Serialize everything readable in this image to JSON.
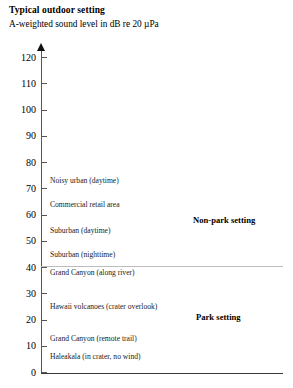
{
  "header": {
    "title": "Typical outdoor setting",
    "subtitle": "A-weighted sound level in dB re 20 µPa"
  },
  "chart_data": {
    "type": "scatter",
    "title": "Typical outdoor setting",
    "subtitle": "A-weighted sound level in dB re 20 µPa",
    "xlabel": "",
    "ylabel": "A-weighted sound level in dB re 20 µPa",
    "ylim": [
      0,
      120
    ],
    "ytick_labels": [
      "120",
      "110",
      "100",
      "90",
      "80",
      "70",
      "60",
      "50",
      "40",
      "30",
      "20",
      "10",
      "0"
    ],
    "ytick_values": [
      120,
      110,
      100,
      90,
      80,
      70,
      60,
      50,
      40,
      30,
      20,
      10,
      0
    ],
    "grid": false,
    "legend": "none",
    "categories": [
      "Noisy urban (daytime)",
      "Commercial retail area",
      "Suburban (daytime)",
      "Suburban (nighttime)",
      "Grand Canyon (along river)",
      "Hawaii volcanoes (crater overlook)",
      "Grand Canyon (remote trail)",
      "Haleakala (in crater, no wind)"
    ],
    "values": [
      73,
      64,
      54,
      45,
      38,
      25,
      13,
      6
    ],
    "annotations": [
      {
        "text": "Non-park setting",
        "value": 58
      },
      {
        "text": "Park setting",
        "value": 21
      }
    ],
    "reference_lines": [
      {
        "value": 40,
        "color": "#bdbdbd"
      },
      {
        "value": 0,
        "color": "#3a3a3a"
      }
    ]
  },
  "axis": {
    "ticks": [
      {
        "label": "120",
        "value": 120
      },
      {
        "label": "110",
        "value": 110
      },
      {
        "label": "100",
        "value": 100
      },
      {
        "label": "90",
        "value": 90
      },
      {
        "label": "80",
        "value": 80
      },
      {
        "label": "70",
        "value": 70
      },
      {
        "label": "60",
        "value": 60
      },
      {
        "label": "50",
        "value": 50
      },
      {
        "label": "40",
        "value": 40
      },
      {
        "label": "30",
        "value": 30
      },
      {
        "label": "20",
        "value": 20
      },
      {
        "label": "10",
        "value": 10
      },
      {
        "label": "0",
        "value": 0
      }
    ]
  },
  "data_labels": [
    {
      "text": "Noisy urban (daytime)",
      "value": 73
    },
    {
      "text": "Commercial retail area",
      "value": 64
    },
    {
      "text": "Suburban (daytime)",
      "value": 54
    },
    {
      "text": "Suburban (nighttime)",
      "value": 45
    },
    {
      "text": "Grand Canyon (along river)",
      "value": 38
    },
    {
      "text": "Hawaii volcanoes (crater overlook)",
      "value": 25
    },
    {
      "text": "Grand Canyon (remote trail)",
      "value": 13
    },
    {
      "text": "Haleakala (in crater, no wind)",
      "value": 6
    }
  ],
  "annotations": [
    {
      "text": "Non-park setting",
      "value": 58
    },
    {
      "text": "Park setting",
      "value": 21
    }
  ]
}
